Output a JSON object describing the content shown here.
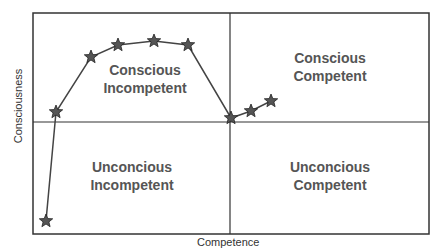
{
  "diagram": {
    "x_axis_label": "Competence",
    "y_axis_label": "Consciousness",
    "quadrants": [
      {
        "position": "top-left",
        "line1": "Conscious",
        "line2": "Incompetent"
      },
      {
        "position": "top-right",
        "line1": "Conscious",
        "line2": "Competent"
      },
      {
        "position": "bottom-left",
        "line1": "Unconcious",
        "line2": "Incompetent"
      },
      {
        "position": "bottom-right",
        "line1": "Unconcious",
        "line2": "Competent"
      }
    ],
    "path_points": [
      [
        46,
        221
      ],
      [
        56,
        112
      ],
      [
        91,
        57
      ],
      [
        118,
        45
      ],
      [
        154,
        41
      ],
      [
        188,
        45
      ],
      [
        231,
        118
      ],
      [
        251,
        111
      ],
      [
        271,
        101
      ]
    ],
    "colors": {
      "line": "#444444",
      "star_fill": "#555555",
      "border": "#333333",
      "text": "#555555"
    }
  }
}
